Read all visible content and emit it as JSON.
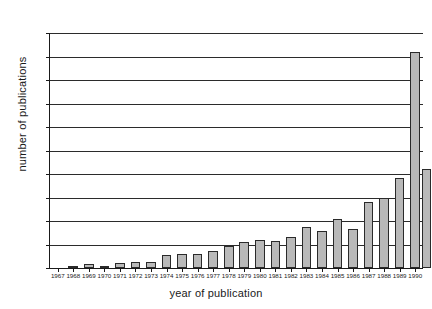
{
  "chart_data": {
    "type": "bar",
    "title": "",
    "xlabel": "year of publication",
    "ylabel": "number of publications",
    "categories": [
      "1967",
      "1968",
      "1969",
      "1970",
      "1971",
      "1972",
      "1973",
      "1974",
      "1975",
      "1976",
      "1977",
      "1978",
      "1979",
      "1980",
      "1981",
      "1982",
      "1983",
      "1984",
      "1985",
      "1986",
      "1987",
      "1988",
      "1989",
      "1990"
    ],
    "values": [
      0,
      2,
      8,
      5,
      11,
      13,
      13,
      28,
      30,
      30,
      36,
      46,
      55,
      60,
      57,
      67,
      88,
      78,
      105,
      83,
      140,
      150,
      192,
      460
    ],
    "ylim": [
      0,
      500
    ],
    "yticks": [
      0,
      50,
      100,
      150,
      200,
      250,
      300,
      350,
      400,
      450,
      500
    ],
    "ytick_labels": [
      "0",
      "50",
      "100",
      "150",
      "200",
      "250",
      "300",
      "350",
      "400",
      "450",
      "500"
    ],
    "grid": true,
    "legend": "none",
    "bar_color": "#b9b9b9",
    "bar_edge_color": "#2a2a2a",
    "axis_color": "#1a1a1a",
    "background_color": "#ffffff"
  },
  "extra_bar": {
    "category": "1990",
    "value": 210
  }
}
